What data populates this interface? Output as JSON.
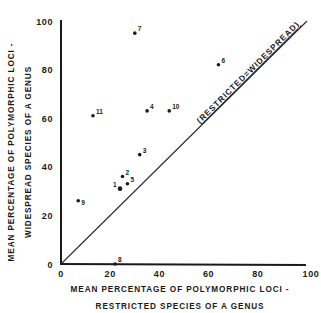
{
  "chart_data": {
    "type": "scatter",
    "title": "",
    "xlabel": [
      "MEAN PERCENTAGE OF POLYMORPHIC LOCI -",
      "RESTRICTED SPECIES OF A GENUS"
    ],
    "ylabel": [
      "MEAN PERCENTAGE OF POLYMORPHIC LOCI -",
      "WIDESPREAD SPECIES OF A GENUS"
    ],
    "xlim": [
      0,
      100
    ],
    "ylim": [
      0,
      100
    ],
    "x_ticks": [
      0,
      20,
      40,
      60,
      80,
      100
    ],
    "y_ticks": [
      0,
      20,
      40,
      60,
      80,
      100
    ],
    "grid": false,
    "legend": null,
    "reference_line": {
      "from": [
        0,
        0
      ],
      "to": [
        100,
        100
      ],
      "label": "(RESTRICTED=WIDESPREAD)"
    },
    "points": [
      {
        "label": "1",
        "x": 24,
        "y": 31
      },
      {
        "label": "2",
        "x": 25,
        "y": 36
      },
      {
        "label": "3",
        "x": 32,
        "y": 45
      },
      {
        "label": "4",
        "x": 35,
        "y": 63
      },
      {
        "label": "5",
        "x": 27,
        "y": 33
      },
      {
        "label": "6",
        "x": 64,
        "y": 82
      },
      {
        "label": "7",
        "x": 30,
        "y": 95
      },
      {
        "label": "8",
        "x": 22,
        "y": 0
      },
      {
        "label": "9",
        "x": 7,
        "y": 26
      },
      {
        "label": "10",
        "x": 44,
        "y": 63
      },
      {
        "label": "11",
        "x": 13,
        "y": 61
      }
    ]
  },
  "labels": {
    "x_line1": "MEAN PERCENTAGE OF POLYMORPHIC LOCI -",
    "x_line2": "RESTRICTED SPECIES OF A GENUS",
    "y_line1": "MEAN PERCENTAGE OF POLYMORPHIC LOCI -",
    "y_line2": "WIDESPREAD SPECIES OF A GENUS",
    "diagonal": "(RESTRICTED=WIDESPREAD)"
  },
  "colors": {
    "ink": "#1a1a1a",
    "background": "#ffffff"
  }
}
